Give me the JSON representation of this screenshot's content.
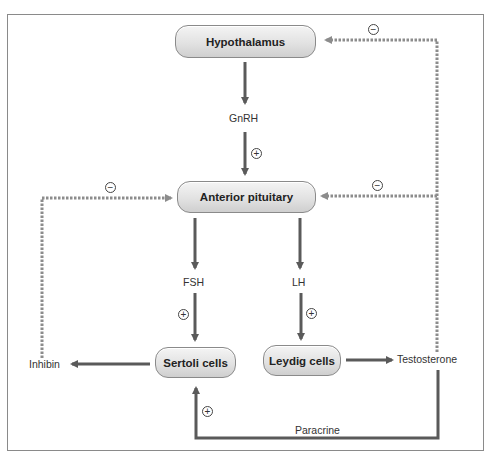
{
  "colors": {
    "arrow_solid": "#5a5a5a",
    "arrow_dashed": "#8c8c8c",
    "box_fill_top": "#f4f4f4",
    "box_fill_bottom": "#cfcfcf",
    "box_border": "#8a8a8a"
  },
  "nodes": {
    "hypothalamus": "Hypothalamus",
    "anterior_pituitary": "Anterior pituitary",
    "sertoli_cells": "Sertoli cells",
    "leydig_cells": "Leydig cells"
  },
  "labels": {
    "gnrh": "GnRH",
    "fsh": "FSH",
    "lh": "LH",
    "inhibin": "Inhibin",
    "testosterone": "Testosterone",
    "paracrine": "Paracrine"
  },
  "signs": {
    "gnrh_stimulates": "+",
    "fsh_stimulates": "+",
    "lh_stimulates": "+",
    "paracrine_stimulates": "+",
    "testosterone_inhibits_hypothalamus": "−",
    "testosterone_inhibits_pituitary": "−",
    "inhibin_inhibits_pituitary": "−"
  }
}
